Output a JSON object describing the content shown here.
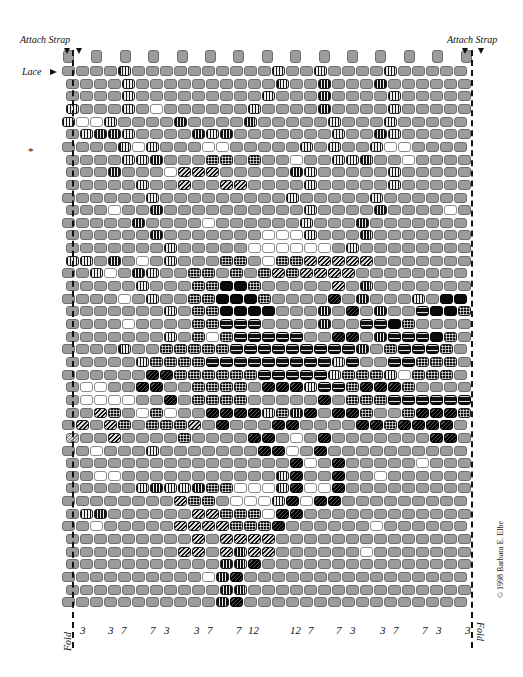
{
  "labels": {
    "attach_strap_left": "Attach Strap",
    "attach_strap_right": "Attach Strap",
    "lace": "Lace",
    "star": "*",
    "fold_left": "Fold",
    "fold_right": "Fold",
    "copyright": "© 1998 Barbara E. Elbe"
  },
  "column_numbers": [
    {
      "text": "3",
      "x": 80
    },
    {
      "text": "3",
      "x": 108
    },
    {
      "text": "7",
      "x": 121
    },
    {
      "text": "7",
      "x": 150
    },
    {
      "text": "3",
      "x": 164
    },
    {
      "text": "3",
      "x": 194
    },
    {
      "text": "7",
      "x": 207
    },
    {
      "text": "7",
      "x": 236
    },
    {
      "text": "12",
      "x": 248
    },
    {
      "text": "12",
      "x": 290
    },
    {
      "text": "7",
      "x": 308
    },
    {
      "text": "7",
      "x": 336
    },
    {
      "text": "3",
      "x": 350
    },
    {
      "text": "3",
      "x": 380
    },
    {
      "text": "7",
      "x": 393
    },
    {
      "text": "7",
      "x": 422
    },
    {
      "text": "3",
      "x": 436
    },
    {
      "text": "3",
      "x": 465
    }
  ],
  "legend": {
    "g": "gray bead",
    "w": "white bead",
    "v": "vertical-striped bead",
    "c": "checkered bead",
    "d": "diagonal-striped bead",
    "D": "dark diagonal bead",
    "b": "black bead",
    "h": "black horizontal-striped bead",
    "l": "gray horizontal-lined bead",
    "s": "light hatched bead"
  },
  "colors": {
    "bead_gray": "#9c9c9c",
    "bead_outline": "#6e6e6e",
    "black": "#0a0a0a",
    "white": "#ffffff"
  },
  "grid": {
    "left": 62,
    "top": 66,
    "pitch_x": 14.0,
    "pitch_y": 12.65,
    "offset_x": 4,
    "tabs": 15,
    "rows": [
      "ggggvggggggggggvggvggggvgggggg",
      "ggggvggggggggggvggvgggvggggggg",
      "ggggvgggggggggvgggvggggvggggg",
      "vgggvgwggggggvggggvggggvggggg",
      "vwwvggggvggggvgggggvgggvggggg",
      "gvvvvggggvvvgggggggvggvvgggg",
      "ggggvwvgggwwgggggvgvggvwwgg",
      "ggggvvvgggccgcggwggvvvggwgggg",
      "gggvgggwdddgggggvvgggggvggggg",
      "gggggvggdggddggggvgggggvggggg",
      "ggggggvgggggggggvgggggvgggggg",
      "gggwggvggggggggggvggggvggggwg",
      "gggggvggggwggggggvgggvgggggg",
      "ggggggvgggggggwwwvgggvgggggg",
      "gggggggvgggggwwwwwwgvggggggg",
      "vvgvgwgvgggccgwccdddddgggggg",
      "ggvwgvvggccgcgcdcddddgggggggg",
      "gggggvgggccbbcgggggdgvggggggg",
      "ggggwgvggccbbbcggggDgvgggvgbbg",
      "gggggggvgccbbbbgggvgDgvgghbbc",
      "ggggwggggcchhhggggvgghhbcggg",
      "gggggggvgcwchhhhhggDDgvhhhbcg",
      "ggggvggccccchhhhhhhhhvgchhhcgg",
      "gggggvcccchhhhhhhhhvhgghhcccg",
      "ggggggDDcccccchhhhhvcccvwcccg",
      "gwwggDDggccccgDDDvhhcDDDcgggg",
      "gwwwwggDgccccgggggDgccchhhhhhg",
      "ggdcgwcwggDDDDvcvDgDDcggcDDDcg",
      "gdgdcgcccdgDgggDDggggDDcDDDDgg",
      "sggdggggcggggDDgwgDgggggggDDg",
      "ggwgggvgggggggDDwgDggggggggg",
      "ggggggggggggggggDwgDgggggwggg",
      "ggwwgggggggggggvDggDggwggggg",
      "gggggvvvvvccwwwvDwwDgggggggg",
      "ggggggggdccgwwwvDwDDgggggggg",
      "gvvggggggddcccwDDgggggggggg",
      "ggwgggggddddcccDggggggwggg",
      "gggggggggdgddddgggggggggg",
      "ggggggggddgdvddggggggwggg",
      "gggggggggggvvDgggggggggg",
      "ggggggggggwvDgggggggggggg",
      "gggggggggggvvgggggggggggggg",
      "gggggggggggvDgggggggggggggg"
    ]
  }
}
